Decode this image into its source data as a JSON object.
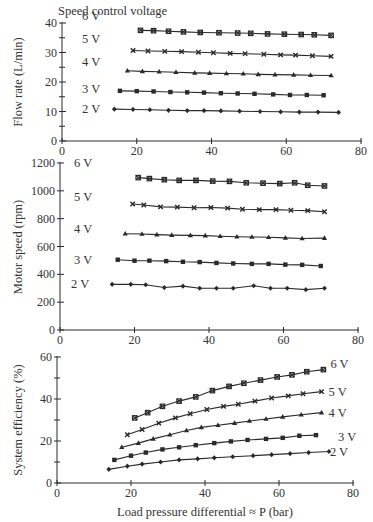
{
  "figure": {
    "top_annotation": "Speed control voltage",
    "shared_xlabel": "Load pressure differential ≈ P (bar)",
    "x_ticks": [
      0,
      20,
      40,
      60,
      80
    ],
    "ink_color": "#2a2a2a"
  },
  "chart_data": [
    {
      "type": "line",
      "title": "",
      "xlabel": "",
      "ylabel": "Flow rate  (L/min)",
      "xlim": [
        0,
        80
      ],
      "ylim": [
        0,
        40
      ],
      "y_ticks": [
        0,
        10,
        20,
        30,
        40
      ],
      "y_minor": 5,
      "legend_position": "inline-left",
      "series": [
        {
          "name": "6 V",
          "marker": "square-x",
          "x": [
            21,
            24.5,
            28.5,
            32.5,
            37,
            42,
            47,
            50.5,
            55,
            59.5,
            64,
            67.5,
            72
          ],
          "y": [
            37.5,
            37.4,
            37.2,
            37.0,
            36.8,
            36.7,
            36.6,
            36.5,
            36.3,
            36.2,
            36.1,
            36.0,
            35.8
          ]
        },
        {
          "name": "5 V",
          "marker": "x",
          "x": [
            19,
            23,
            27.5,
            32,
            36.5,
            40.5,
            45,
            49,
            54,
            58.5,
            62.5,
            67,
            72
          ],
          "y": [
            30.7,
            30.5,
            30.4,
            30.3,
            30.1,
            29.9,
            29.7,
            29.6,
            29.4,
            29.2,
            29.1,
            28.9,
            28.7
          ]
        },
        {
          "name": "4 V",
          "marker": "triangle",
          "x": [
            17.5,
            21.5,
            26,
            30.5,
            35.5,
            39.5,
            44,
            48.5,
            52.5,
            57,
            62,
            66.5,
            72
          ],
          "y": [
            23.8,
            23.6,
            23.5,
            23.3,
            23.1,
            23.0,
            22.9,
            22.8,
            22.6,
            22.5,
            22.4,
            22.3,
            22.2
          ]
        },
        {
          "name": "3 V",
          "marker": "square",
          "x": [
            15.5,
            20,
            24.5,
            29,
            33.5,
            38,
            42.5,
            47,
            51.5,
            56.5,
            61,
            65.5,
            70
          ],
          "y": [
            17.0,
            16.9,
            16.8,
            16.6,
            16.5,
            16.4,
            16.2,
            16.1,
            16.0,
            15.8,
            15.6,
            15.6,
            15.5
          ]
        },
        {
          "name": "2 V",
          "marker": "diamond",
          "x": [
            14,
            19,
            23.5,
            28.5,
            33.5,
            38,
            42.5,
            47.5,
            53,
            58.5,
            63.5,
            68.5,
            74
          ],
          "y": [
            10.8,
            10.7,
            10.6,
            10.4,
            10.3,
            10.3,
            10.2,
            10.1,
            10.0,
            9.9,
            9.8,
            9.8,
            9.7
          ]
        }
      ]
    },
    {
      "type": "line",
      "title": "",
      "xlabel": "",
      "ylabel": "Motor speed (rpm)",
      "xlim": [
        0,
        80
      ],
      "ylim": [
        0,
        1200
      ],
      "y_ticks": [
        0,
        200,
        400,
        600,
        800,
        1000,
        1200
      ],
      "y_minor": 0,
      "legend_position": "inline-left",
      "series": [
        {
          "name": "6 V",
          "marker": "square-x",
          "x": [
            21,
            24,
            28,
            32,
            36.5,
            41,
            45.5,
            50,
            54.5,
            59,
            63,
            66.5,
            71
          ],
          "y": [
            1095,
            1088,
            1080,
            1075,
            1075,
            1070,
            1068,
            1058,
            1055,
            1052,
            1058,
            1040,
            1035
          ]
        },
        {
          "name": "5 V",
          "marker": "x",
          "x": [
            19.5,
            22.5,
            27,
            31.5,
            36,
            40.5,
            45,
            49,
            53.5,
            58,
            62,
            66.5,
            71
          ],
          "y": [
            905,
            898,
            885,
            883,
            878,
            880,
            876,
            868,
            865,
            865,
            860,
            858,
            850
          ]
        },
        {
          "name": "4 V",
          "marker": "triangle",
          "x": [
            17.5,
            22,
            26,
            30,
            35,
            39,
            43,
            47.5,
            51.5,
            56,
            60.5,
            65,
            71
          ],
          "y": [
            692,
            690,
            685,
            682,
            680,
            678,
            674,
            670,
            668,
            666,
            662,
            658,
            660
          ]
        },
        {
          "name": "3 V",
          "marker": "square",
          "x": [
            15.5,
            20,
            24,
            28.5,
            33,
            37.5,
            42,
            46.5,
            51.5,
            56,
            60.5,
            65,
            70
          ],
          "y": [
            505,
            498,
            498,
            495,
            490,
            488,
            482,
            478,
            475,
            475,
            470,
            468,
            460
          ]
        },
        {
          "name": "2 V",
          "marker": "diamond",
          "x": [
            14,
            19,
            23,
            28,
            33,
            37.5,
            42,
            46.5,
            52,
            56.5,
            61,
            66,
            71
          ],
          "y": [
            328,
            328,
            325,
            305,
            315,
            300,
            300,
            300,
            318,
            300,
            300,
            290,
            300
          ]
        }
      ]
    },
    {
      "type": "line",
      "title": "",
      "xlabel": "Load pressure differential ≈ P (bar)",
      "ylabel": "System efficiency (%)",
      "xlim": [
        0,
        80
      ],
      "ylim": [
        0,
        60
      ],
      "y_ticks": [
        0,
        20,
        40,
        60
      ],
      "y_minor": 10,
      "legend_position": "inline-right",
      "series": [
        {
          "name": "6 V",
          "marker": "square-x",
          "x": [
            21,
            24.5,
            28.5,
            33,
            37.5,
            42,
            46.5,
            50.5,
            55,
            59.5,
            63.5,
            67.5,
            72
          ],
          "y": [
            31,
            33.5,
            36.5,
            39,
            41,
            44,
            46,
            47.5,
            49,
            50.5,
            51.5,
            53,
            54
          ]
        },
        {
          "name": "5 V",
          "marker": "x",
          "x": [
            19,
            23,
            27.5,
            32,
            36,
            40.5,
            45,
            49,
            53.5,
            58,
            62.5,
            66.5,
            71.5
          ],
          "y": [
            23,
            25.5,
            28.5,
            31,
            33,
            35,
            36.5,
            37.5,
            39,
            40.5,
            41.5,
            42.5,
            43.5
          ]
        },
        {
          "name": "4 V",
          "marker": "triangle",
          "x": [
            17.5,
            22,
            26,
            30.5,
            35,
            39,
            43.5,
            48,
            52,
            56.5,
            61,
            66,
            71.5
          ],
          "y": [
            17,
            19,
            21,
            23,
            25,
            26.5,
            27.5,
            28.5,
            29.5,
            30.5,
            31.5,
            32.5,
            33.5
          ]
        },
        {
          "name": "3 V",
          "marker": "square",
          "x": [
            15.5,
            20,
            24,
            28.5,
            33,
            37.5,
            42.5,
            47,
            51.5,
            56.5,
            61,
            65.5,
            70
          ],
          "y": [
            11,
            13,
            14.5,
            16,
            17,
            18,
            19,
            19.8,
            20.5,
            21,
            21.5,
            22.5,
            22.8
          ]
        },
        {
          "name": "2 V",
          "marker": "diamond",
          "x": [
            14,
            19,
            23,
            28,
            33,
            38,
            42.5,
            47.5,
            53,
            58,
            63,
            68,
            73.5
          ],
          "y": [
            6.5,
            8,
            9,
            10,
            11,
            11.5,
            12,
            12.5,
            13,
            13.5,
            14,
            14.5,
            15
          ]
        }
      ]
    }
  ]
}
